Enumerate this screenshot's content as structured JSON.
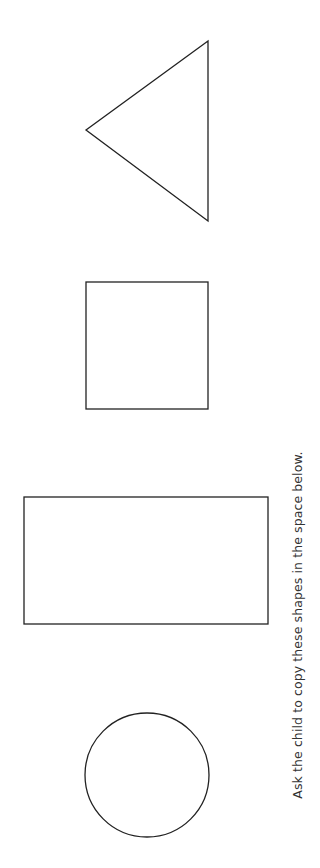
{
  "worksheet": {
    "instruction": "Ask the child to copy these shapes in the space below.",
    "stroke_color": "#222222",
    "background_color": "#ffffff",
    "shapes": [
      {
        "name": "triangle",
        "points": "208,41 86,130 208,221"
      },
      {
        "name": "square",
        "x": 86,
        "y": 282,
        "width": 122,
        "height": 127
      },
      {
        "name": "rectangle",
        "x": 24,
        "y": 497,
        "width": 244,
        "height": 127
      },
      {
        "name": "circle",
        "cx": 147,
        "cy": 775,
        "r": 62
      }
    ]
  }
}
